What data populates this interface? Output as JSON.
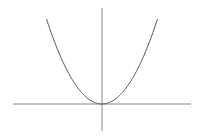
{
  "chart_data": {
    "type": "line",
    "title": "",
    "xlabel": "",
    "ylabel": "",
    "function": "y = x^2",
    "series": [
      {
        "name": "parabola",
        "x": [
          -3,
          -2.5,
          -2,
          -1.5,
          -1,
          -0.5,
          0,
          0.5,
          1,
          1.5,
          2,
          2.5,
          3
        ],
        "values": [
          9,
          6.25,
          4,
          2.25,
          1,
          0.25,
          0,
          0.25,
          1,
          2.25,
          4,
          6.25,
          9
        ]
      }
    ],
    "xlim": [
      -5.5,
      5.0
    ],
    "ylim": [
      -2.5,
      10.5
    ],
    "grid": false,
    "legend": null,
    "colors": {
      "curve": "#555555",
      "axes": "#777777",
      "background": "#ffffff"
    }
  }
}
